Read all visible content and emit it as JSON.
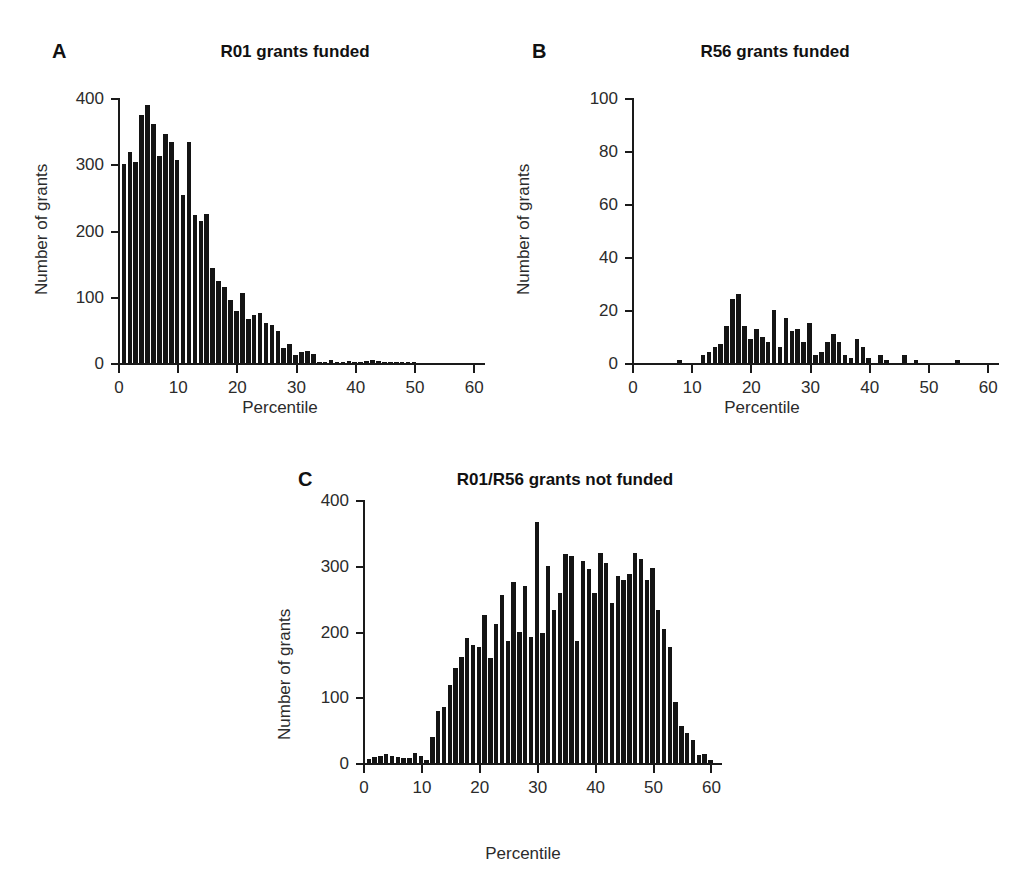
{
  "figure": {
    "background": "#ffffff",
    "bar_color": "#141414",
    "axis_color": "#1a1a1a",
    "text_color": "#2b2b2b"
  },
  "panels": [
    {
      "letter": "A",
      "title": "R01 grants funded",
      "xlabel": "Percentile",
      "ylabel": "Number of grants"
    },
    {
      "letter": "B",
      "title": "R56 grants funded",
      "xlabel": "Percentile",
      "ylabel": "Number of grants"
    },
    {
      "letter": "C",
      "title": "R01/R56 grants not funded",
      "xlabel": "Percentile",
      "ylabel": "Number of grants"
    }
  ],
  "chart_data": [
    {
      "type": "bar",
      "panel": "A",
      "title": "R01 grants funded",
      "xlabel": "Percentile",
      "ylabel": "Number of grants",
      "xlim": [
        0,
        62
      ],
      "ylim": [
        0,
        400
      ],
      "xticks": [
        0,
        10,
        20,
        30,
        40,
        50,
        60
      ],
      "xticklabels": [
        "0",
        "10",
        "20",
        "30",
        "40",
        "50",
        "60"
      ],
      "yticks": [
        0,
        100,
        200,
        300,
        400
      ],
      "yticklabels": [
        "0",
        "100",
        "200",
        "300",
        "400"
      ],
      "grid": false,
      "legend": false,
      "x": [
        1,
        2,
        3,
        4,
        5,
        6,
        7,
        8,
        9,
        10,
        11,
        12,
        13,
        14,
        15,
        16,
        17,
        18,
        19,
        20,
        21,
        22,
        23,
        24,
        25,
        26,
        27,
        28,
        29,
        30,
        31,
        32,
        33,
        34,
        35,
        36,
        37,
        38,
        39,
        40,
        41,
        42,
        43,
        44,
        45,
        46,
        47,
        48,
        49,
        50,
        51,
        52,
        53,
        54,
        55,
        56,
        57,
        58,
        59,
        60,
        61
      ],
      "values": [
        301,
        318,
        304,
        375,
        390,
        361,
        313,
        345,
        334,
        307,
        253,
        334,
        224,
        215,
        225,
        144,
        124,
        114,
        95,
        79,
        105,
        66,
        73,
        75,
        60,
        57,
        48,
        23,
        29,
        12,
        17,
        18,
        13,
        2,
        2,
        4,
        2,
        2,
        3,
        1,
        1,
        3,
        4,
        3,
        1,
        1,
        1,
        2,
        2,
        1,
        0,
        0,
        0,
        0,
        0,
        0,
        0,
        0,
        0,
        0,
        0
      ]
    },
    {
      "type": "bar",
      "panel": "B",
      "title": "R56 grants funded",
      "xlabel": "Percentile",
      "ylabel": "Number of grants",
      "xlim": [
        0,
        62
      ],
      "ylim": [
        0,
        100
      ],
      "xticks": [
        0,
        10,
        20,
        30,
        40,
        50,
        60
      ],
      "xticklabels": [
        "0",
        "10",
        "20",
        "30",
        "40",
        "50",
        "60"
      ],
      "yticks": [
        0,
        20,
        40,
        60,
        80,
        100
      ],
      "yticklabels": [
        "0",
        "20",
        "40",
        "60",
        "80",
        "100"
      ],
      "grid": false,
      "legend": false,
      "x": [
        1,
        2,
        3,
        4,
        5,
        6,
        7,
        8,
        9,
        10,
        11,
        12,
        13,
        14,
        15,
        16,
        17,
        18,
        19,
        20,
        21,
        22,
        23,
        24,
        25,
        26,
        27,
        28,
        29,
        30,
        31,
        32,
        33,
        34,
        35,
        36,
        37,
        38,
        39,
        40,
        41,
        42,
        43,
        44,
        45,
        46,
        47,
        48,
        49,
        50,
        51,
        52,
        53,
        54,
        55,
        56,
        57,
        58,
        59,
        60,
        61
      ],
      "values": [
        0,
        0,
        0,
        0,
        0,
        0,
        0,
        1,
        0,
        0,
        0,
        3,
        4,
        6,
        7,
        14,
        24,
        26,
        14,
        9,
        13,
        10,
        8,
        20,
        6,
        17,
        12,
        13,
        8,
        15,
        3,
        4,
        8,
        11,
        8,
        3,
        2,
        9,
        6,
        2,
        0,
        3,
        1,
        0,
        0,
        3,
        0,
        1,
        0,
        0,
        0,
        0,
        0,
        0,
        1,
        0,
        0,
        0,
        0,
        0,
        0
      ]
    },
    {
      "type": "bar",
      "panel": "C",
      "title": "R01/R56 grants not funded",
      "xlabel": "Percentile",
      "ylabel": "Number of grants",
      "xlim": [
        0,
        62
      ],
      "ylim": [
        0,
        400
      ],
      "xticks": [
        0,
        10,
        20,
        30,
        40,
        50,
        60
      ],
      "xticklabels": [
        "0",
        "10",
        "20",
        "30",
        "40",
        "50",
        "60"
      ],
      "yticks": [
        0,
        100,
        200,
        300,
        400
      ],
      "yticklabels": [
        "0",
        "100",
        "200",
        "300",
        "400"
      ],
      "grid": false,
      "legend": false,
      "x": [
        1,
        2,
        3,
        4,
        5,
        6,
        7,
        8,
        9,
        10,
        11,
        12,
        13,
        14,
        15,
        16,
        17,
        18,
        19,
        20,
        21,
        22,
        23,
        24,
        25,
        26,
        27,
        28,
        29,
        30,
        31,
        32,
        33,
        34,
        35,
        36,
        37,
        38,
        39,
        40,
        41,
        42,
        43,
        44,
        45,
        46,
        47,
        48,
        49,
        50,
        51,
        52,
        53,
        54,
        55,
        56,
        57,
        58,
        59,
        60,
        61
      ],
      "values": [
        6,
        9,
        11,
        13,
        10,
        9,
        8,
        7,
        15,
        10,
        4,
        39,
        79,
        85,
        119,
        144,
        162,
        190,
        179,
        176,
        225,
        159,
        211,
        256,
        185,
        275,
        199,
        269,
        192,
        366,
        197,
        300,
        232,
        258,
        318,
        315,
        185,
        307,
        295,
        259,
        319,
        304,
        243,
        284,
        279,
        288,
        319,
        311,
        279,
        296,
        232,
        204,
        176,
        93,
        57,
        45,
        35,
        12,
        14,
        5,
        0
      ]
    }
  ]
}
